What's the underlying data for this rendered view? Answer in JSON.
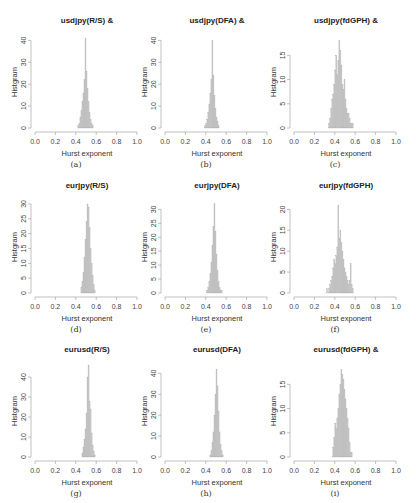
{
  "chart_data": [
    {
      "id": "a",
      "type": "bar",
      "title": "usdjpy(R/S) &",
      "caption": "(a)",
      "xlabel": "Hurst exponent",
      "ylabel": "Histgram",
      "xlim": [
        0,
        1
      ],
      "xticks": [
        "0.0",
        "0.2",
        "0.4",
        "0.6",
        "0.8",
        "1.0"
      ],
      "ylim": [
        0,
        42
      ],
      "yticks": [
        0,
        10,
        20,
        30,
        40
      ],
      "bin_start": 0.42,
      "bin_width": 0.01,
      "values": [
        1,
        2,
        5,
        8,
        12,
        16,
        22,
        41,
        26,
        18,
        12,
        7,
        4,
        2,
        1
      ]
    },
    {
      "id": "b",
      "type": "bar",
      "title": "usdjpy(DFA) &",
      "caption": "(b)",
      "xlabel": "Hurst exponent",
      "ylabel": "Histgram",
      "xlim": [
        0,
        1
      ],
      "xticks": [
        "0.0",
        "0.2",
        "0.4",
        "0.6",
        "0.8",
        "1.0"
      ],
      "ylim": [
        0,
        42
      ],
      "yticks": [
        0,
        10,
        20,
        30,
        40
      ],
      "bin_start": 0.39,
      "bin_width": 0.01,
      "values": [
        1,
        2,
        4,
        7,
        11,
        16,
        22,
        40,
        24,
        15,
        9,
        5,
        3,
        1
      ]
    },
    {
      "id": "c",
      "type": "bar",
      "title": "usdjpy(fdGPH) &",
      "caption": "(c)",
      "xlabel": "Hurst exponent",
      "ylabel": "Histgram",
      "xlim": [
        0,
        1
      ],
      "xticks": [
        "0.0",
        "0.2",
        "0.4",
        "0.6",
        "0.8",
        "1.0"
      ],
      "ylim": [
        0,
        19
      ],
      "yticks": [
        0,
        5,
        10,
        15
      ],
      "bin_start": 0.34,
      "bin_width": 0.01,
      "values": [
        1,
        2,
        4,
        6,
        7,
        9,
        12,
        15,
        11,
        14,
        18,
        16,
        13,
        9,
        8,
        10,
        6,
        4,
        3,
        3,
        2,
        1,
        1,
        1
      ]
    },
    {
      "id": "d",
      "type": "bar",
      "title": "eurjpy(R/S)",
      "caption": "(d)",
      "xlabel": "Hurst exponent",
      "ylabel": "Histgram",
      "xlim": [
        0,
        1
      ],
      "xticks": [
        "0.0",
        "0.2",
        "0.4",
        "0.6",
        "0.8",
        "1.0"
      ],
      "ylim": [
        0,
        31
      ],
      "yticks": [
        0,
        5,
        10,
        15,
        20,
        25,
        30
      ],
      "bin_start": 0.45,
      "bin_width": 0.01,
      "values": [
        2,
        4,
        7,
        12,
        18,
        24,
        30,
        29,
        22,
        15,
        10,
        6,
        3,
        1
      ]
    },
    {
      "id": "e",
      "type": "bar",
      "title": "eurjpy(DFA)",
      "caption": "(e)",
      "xlabel": "Hurst exponent",
      "ylabel": "Histgram",
      "xlim": [
        0,
        1
      ],
      "xticks": [
        "0.0",
        "0.2",
        "0.4",
        "0.6",
        "0.8",
        "1.0"
      ],
      "ylim": [
        0,
        33
      ],
      "yticks": [
        0,
        5,
        10,
        15,
        20,
        25,
        30
      ],
      "bin_start": 0.41,
      "bin_width": 0.01,
      "values": [
        1,
        2,
        4,
        7,
        11,
        17,
        24,
        32,
        22,
        14,
        8,
        4,
        2,
        1,
        1
      ]
    },
    {
      "id": "f",
      "type": "bar",
      "title": "eurjpy(fdGPH)",
      "caption": "(f)",
      "xlabel": "Hurst exponent",
      "ylabel": "Histgram",
      "xlim": [
        0,
        1
      ],
      "xticks": [
        "0.0",
        "0.2",
        "0.4",
        "0.6",
        "0.8",
        "1.0"
      ],
      "ylim": [
        0,
        22
      ],
      "yticks": [
        0,
        5,
        10,
        15,
        20
      ],
      "bin_start": 0.32,
      "bin_width": 0.01,
      "values": [
        1,
        0,
        1,
        2,
        3,
        4,
        6,
        8,
        7,
        9,
        11,
        21,
        13,
        15,
        12,
        10,
        8,
        6,
        5,
        4,
        3,
        2,
        3,
        7,
        2,
        1
      ]
    },
    {
      "id": "g",
      "type": "bar",
      "title": "eurusd(R/S)",
      "caption": "(g)",
      "xlabel": "Hurst exponent",
      "ylabel": "Histgram",
      "xlim": [
        0,
        1
      ],
      "xticks": [
        "0.0",
        "0.2",
        "0.4",
        "0.6",
        "0.8",
        "1.0"
      ],
      "ylim": [
        0,
        46
      ],
      "yticks": [
        0,
        10,
        20,
        30,
        40
      ],
      "bin_start": 0.46,
      "bin_width": 0.01,
      "values": [
        2,
        5,
        9,
        14,
        22,
        40,
        46,
        28,
        24,
        12,
        6,
        3,
        1
      ]
    },
    {
      "id": "h",
      "type": "bar",
      "title": "eurusd(DFA)",
      "caption": "(h)",
      "xlabel": "Hurst exponent",
      "ylabel": "Histgram",
      "xlim": [
        0,
        1
      ],
      "xticks": [
        "0.0",
        "0.2",
        "0.4",
        "0.6",
        "0.8",
        "1.0"
      ],
      "ylim": [
        0,
        44
      ],
      "yticks": [
        0,
        10,
        20,
        30,
        40
      ],
      "bin_start": 0.44,
      "bin_width": 0.01,
      "values": [
        1,
        3,
        7,
        12,
        20,
        30,
        42,
        34,
        22,
        12,
        6,
        3,
        1
      ]
    },
    {
      "id": "i",
      "type": "bar",
      "title": "eurusd(fdGPH) &",
      "caption": "(i)",
      "xlabel": "Hurst exponent",
      "ylabel": "Histgram",
      "xlim": [
        0,
        1
      ],
      "xticks": [
        "0.0",
        "0.2",
        "0.4",
        "0.6",
        "0.8",
        "1.0"
      ],
      "ylim": [
        0,
        19
      ],
      "yticks": [
        0,
        5,
        10,
        15
      ],
      "bin_start": 0.38,
      "bin_width": 0.01,
      "values": [
        2,
        4,
        7,
        6,
        8,
        10,
        13,
        15,
        18,
        17,
        16,
        14,
        12,
        10,
        8,
        6,
        3,
        1,
        1
      ]
    }
  ]
}
